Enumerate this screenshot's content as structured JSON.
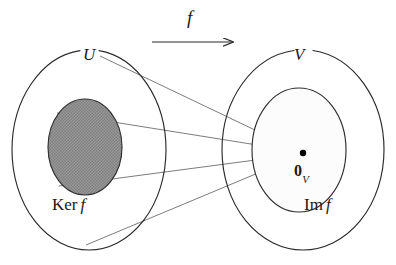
{
  "figure": {
    "background_color": "#ffffff",
    "stroke_color": "#2b2b2b",
    "thin_line_color": "#555555",
    "kernel_fill_color": "#8f8f8f",
    "image_fill_color": "#fbfbfb",
    "point_color": "#000000"
  },
  "labels": {
    "map_arrow": "f",
    "domain": "U",
    "codomain": "V",
    "kernel_prefix": "Ker",
    "kernel_map": "f",
    "image_prefix": "Im",
    "image_map": "f",
    "zero_vector": "0",
    "zero_vector_subscript": "V"
  },
  "shapes": {
    "domain_ellipse": {
      "cx": 89,
      "cy": 150,
      "rx": 77,
      "ry": 100
    },
    "kernel_ellipse": {
      "cx": 85,
      "cy": 147,
      "rx": 37,
      "ry": 48
    },
    "codomain_ellipse": {
      "cx": 303,
      "cy": 150,
      "rx": 81,
      "ry": 100
    },
    "image_ellipse": {
      "cx": 299,
      "cy": 150,
      "rx": 47,
      "ry": 62
    },
    "zero_point": {
      "cx": 303,
      "cy": 153,
      "r": 3.1
    }
  },
  "arrow": {
    "x1": 152,
    "y1": 42,
    "x2": 240,
    "y2": 42,
    "label": "f"
  },
  "connector_lines": [
    {
      "name": "top-connector",
      "x1": 100,
      "y1": 56,
      "x2": 303,
      "y2": 153
    },
    {
      "name": "upper-kernel-connector",
      "x1": 57,
      "y1": 113,
      "x2": 303,
      "y2": 153
    },
    {
      "name": "lower-kernel-connector",
      "x1": 59,
      "y1": 186,
      "x2": 303,
      "y2": 153
    },
    {
      "name": "bottom-connector",
      "x1": 86,
      "y1": 245,
      "x2": 303,
      "y2": 153
    }
  ]
}
